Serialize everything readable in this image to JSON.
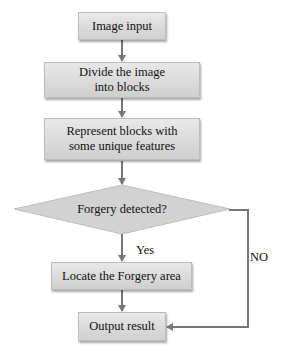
{
  "flowchart": {
    "nodes": [
      {
        "id": "image_input",
        "shape": "rect",
        "label": "Image input"
      },
      {
        "id": "divide",
        "shape": "rect",
        "label": "Divide the image into blocks"
      },
      {
        "id": "represent",
        "shape": "rect",
        "label": "Represent blocks with some unique features"
      },
      {
        "id": "decision",
        "shape": "diamond",
        "label": "Forgery detected?"
      },
      {
        "id": "locate",
        "shape": "rect",
        "label": "Locate the Forgery area"
      },
      {
        "id": "output",
        "shape": "rect",
        "label": "Output result"
      }
    ],
    "edges": [
      {
        "from": "image_input",
        "to": "divide",
        "label": ""
      },
      {
        "from": "divide",
        "to": "represent",
        "label": ""
      },
      {
        "from": "represent",
        "to": "decision",
        "label": ""
      },
      {
        "from": "decision",
        "to": "locate",
        "label": "Yes"
      },
      {
        "from": "locate",
        "to": "output",
        "label": ""
      },
      {
        "from": "decision",
        "to": "output",
        "label": "NO"
      }
    ],
    "labels": {
      "yes": "Yes",
      "no": "NO"
    },
    "colors": {
      "box_top": "#e8e8e8",
      "box_bottom": "#cfcfcf",
      "connector": "#777777",
      "diamond_fill": "#d2d2d2"
    }
  }
}
